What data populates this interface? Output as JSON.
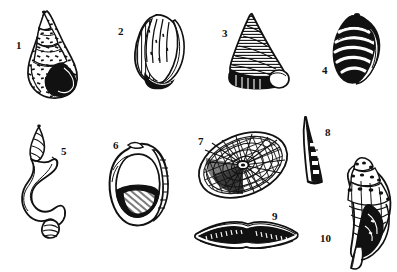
{
  "plate": {
    "title": "Plate of ten numbered sea shells",
    "description": "Black and white pen-and-ink scientific illustration of ten marine mollusc shells arranged in two rows on a white background, each labelled with a number.",
    "background_color": "#ffffff",
    "ink_color": "#111111",
    "width": 397,
    "height": 272,
    "figure_count": 10,
    "specimens": [
      {
        "number": "1",
        "name": "high-spired-speckled-snail-shell",
        "description": "Tall conical spire with pointed apex, mottled speckled surface and dark oval aperture at lower right",
        "label_x": 16,
        "label_y": 40,
        "row": 1
      },
      {
        "number": "2",
        "name": "ribbed-ovate-shell",
        "description": "Rounded ovate shell with fine vertical ribbing and a curved lip along the right side",
        "label_x": 118,
        "label_y": 26,
        "row": 1
      },
      {
        "number": "3",
        "name": "conical-top-shell",
        "description": "Triangular top-shell with dense horizontal hatching and a white rounded aperture at the base",
        "label_x": 222,
        "label_y": 28,
        "row": 1
      },
      {
        "number": "4",
        "name": "banded-nerite-shell",
        "description": "Small ovate nerite with bold black and white spiral banding",
        "label_x": 322,
        "label_y": 65,
        "row": 1
      },
      {
        "number": "5",
        "name": "uncoiled-spiral-shell",
        "description": "Irregular uncoiled shell with a small turreted spire and a long twisting ribbon-like body whorl",
        "label_x": 61,
        "label_y": 146,
        "row": 2
      },
      {
        "number": "6",
        "name": "wide-aperture-ear-shell",
        "description": "Large ear-shaped shell with a very wide open aperture and hatched shading in the lower half",
        "label_x": 113,
        "label_y": 140,
        "row": 2
      },
      {
        "number": "7",
        "name": "radially-ribbed-limpet-shell",
        "description": "Oval limpet seen obliquely with radiating ribs and concentric growth lines converging on a central apex",
        "label_x": 198,
        "label_y": 136,
        "row": 2
      },
      {
        "number": "8",
        "name": "tusk-shell",
        "description": "Slender curved tusk shell tapering to a fine point",
        "label_x": 325,
        "label_y": 127,
        "row": 2
      },
      {
        "number": "9",
        "name": "elongate-bivalve-shell",
        "description": "Flattened elongate shell seen edge on, lens shaped with a dark toothed margin",
        "label_x": 272,
        "label_y": 211,
        "row": 2
      },
      {
        "number": "10",
        "name": "knobbed-whelk-shell",
        "description": "Spindle-shaped whelk with a knobbed spire, spiral sculpture and a long narrow dark aperture with siphonal canal",
        "label_x": 320,
        "label_y": 233,
        "row": 2
      }
    ]
  }
}
